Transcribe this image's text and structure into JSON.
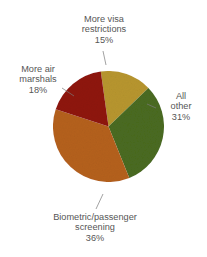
{
  "chart_data": {
    "type": "pie",
    "title": "",
    "xlabel": "",
    "ylabel": "",
    "legend_position": "none",
    "grid": false,
    "unit": "%",
    "total": 100,
    "categories": [
      "More visa restrictions",
      "All other",
      "Biometric/passenger screening",
      "More air marshals"
    ],
    "values": [
      15,
      31,
      36,
      18
    ],
    "slices": [
      {
        "label": "More visa restrictions",
        "value": 15,
        "value_text": "15%",
        "color": "#b8962e",
        "start_angle": -8,
        "sweep": 54,
        "leader": true
      },
      {
        "label": "All other",
        "value": 31,
        "value_text": "31%",
        "color": "#4a6b20",
        "start_angle": 46,
        "sweep": 112,
        "leader": true
      },
      {
        "label": "Biometric/passenger screening",
        "value": 36,
        "value_text": "36%",
        "color": "#b5611f",
        "start_angle": 158,
        "sweep": 130,
        "leader": true
      },
      {
        "label": "More air marshals",
        "value": 18,
        "value_text": "18%",
        "color": "#8f1410",
        "start_angle": 288,
        "sweep": 64,
        "leader": true
      }
    ]
  },
  "labels": {
    "visa": {
      "name_line1": "More visa",
      "name_line2": "restrictions",
      "pct": "15%"
    },
    "air": {
      "name_line1": "More air",
      "name_line2": "marshals",
      "pct": "18%"
    },
    "all_other": {
      "name_line1": "All",
      "name_line2": "other",
      "pct": "31%"
    },
    "biometric": {
      "name_line1": "Biometric/passenger",
      "name_line2": "screening",
      "pct": "36%"
    }
  },
  "header": {
    "title": ""
  }
}
